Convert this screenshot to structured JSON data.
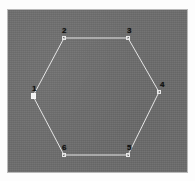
{
  "app": {
    "title": "Polygon View",
    "shape_name": "hexagon"
  },
  "canvas": {
    "background_color": "#6d6d6d",
    "border_color": "#b9b9b9",
    "page_background_color": "#fdfdfd",
    "width": 181,
    "height": 164
  },
  "shape": {
    "type": "hexagon",
    "stroke_color": "#e6e6e6",
    "fill": "none",
    "stroke_width": 1,
    "vertex_count": 6,
    "vertices": [
      {
        "id": "1",
        "label": "1",
        "x": 25,
        "y": 86,
        "handle": "filled",
        "selected": true,
        "label_dx": -1,
        "label_dy": -11
      },
      {
        "id": "2",
        "label": "2",
        "x": 56,
        "y": 28,
        "handle": "open",
        "selected": false,
        "label_dx": -2,
        "label_dy": -11
      },
      {
        "id": "3",
        "label": "3",
        "x": 120,
        "y": 28,
        "handle": "open",
        "selected": false,
        "label_dx": -1,
        "label_dy": -11
      },
      {
        "id": "4",
        "label": "4",
        "x": 151,
        "y": 82,
        "handle": "open",
        "selected": false,
        "label_dx": 1,
        "label_dy": -11
      },
      {
        "id": "5",
        "label": "5",
        "x": 120,
        "y": 145,
        "handle": "open",
        "selected": false,
        "label_dx": -1,
        "label_dy": -11
      },
      {
        "id": "6",
        "label": "6",
        "x": 56,
        "y": 145,
        "handle": "open",
        "selected": false,
        "label_dx": -2,
        "label_dy": -11
      }
    ],
    "path": "M 25 86 L 56 28 L 120 28 L 151 82 L 120 145 L 56 145 Z"
  }
}
